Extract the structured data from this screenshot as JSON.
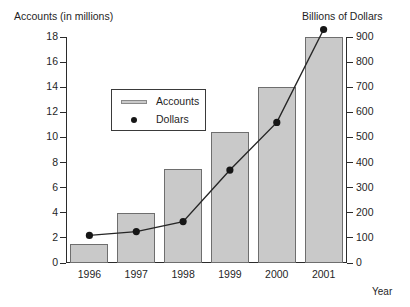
{
  "chart_data": {
    "type": "bar",
    "title": "",
    "categories": [
      "1996",
      "1997",
      "1998",
      "1999",
      "2000",
      "2001"
    ],
    "xlabel": "Year",
    "left_axis": {
      "label": "Accounts (in millions)",
      "ticks": [
        "0",
        "2",
        "4",
        "6",
        "8",
        "10",
        "12",
        "14",
        "16",
        "18"
      ],
      "ylim": [
        0,
        18
      ]
    },
    "right_axis": {
      "label": "Billions of Dollars",
      "ticks": [
        "0",
        "100",
        "200",
        "300",
        "400",
        "500",
        "600",
        "700",
        "800",
        "900"
      ],
      "ylim": [
        0,
        900
      ]
    },
    "grid": false,
    "legend": {
      "position": "inside-upper-left",
      "entries": [
        {
          "label": "Accounts",
          "marker": "bar-swatch",
          "color": "#c9c9c9"
        },
        {
          "label": "Dollars",
          "marker": "dot",
          "color": "#161616"
        }
      ]
    },
    "series": [
      {
        "name": "Accounts",
        "type": "bar",
        "axis": "left",
        "unit": "millions",
        "values": [
          1.5,
          4.0,
          7.5,
          10.4,
          14.0,
          18.0
        ]
      },
      {
        "name": "Dollars",
        "type": "line",
        "axis": "right",
        "unit": "billions",
        "values": [
          110,
          125,
          165,
          370,
          560,
          930
        ]
      }
    ]
  },
  "colors": {
    "bar_fill": "#c9c9c9",
    "bar_edge": "#6e6e6e",
    "line": "#262626",
    "marker": "#161616",
    "axis": "#2b2b2b"
  }
}
